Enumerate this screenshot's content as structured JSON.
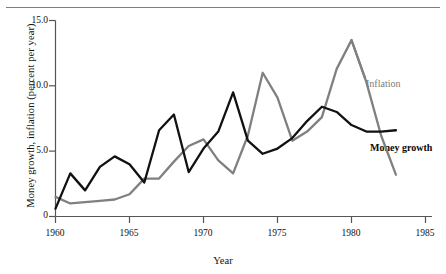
{
  "figure": {
    "ylabel": "Money growth, inflation (percent per year)",
    "xlabel": "Year",
    "top_rule": "horizontal-rule"
  },
  "axes": {
    "ytick_labels": [
      "15.0",
      "10.0",
      "5.0",
      "0"
    ],
    "ytick_values": [
      15.0,
      10.0,
      5.0,
      0
    ],
    "xtick_labels": [
      "1960",
      "1965",
      "1970",
      "1975",
      "1980",
      "1985"
    ],
    "xtick_values": [
      1960,
      1965,
      1970,
      1975,
      1980,
      1985
    ]
  },
  "legend": {
    "inflation_label": "Inflation",
    "money_label": "Money growth"
  },
  "colors": {
    "inflation": "#808080",
    "money_growth": "#111111",
    "axis": "#555555",
    "text": "#111111"
  },
  "chart_data": {
    "type": "line",
    "title": "",
    "xlabel": "Year",
    "ylabel": "Money growth, inflation (percent per year)",
    "xlim": [
      1960,
      1985
    ],
    "ylim": [
      0,
      15
    ],
    "grid": false,
    "legend_position": "inline-right",
    "x": [
      1960,
      1961,
      1962,
      1963,
      1964,
      1965,
      1966,
      1967,
      1968,
      1969,
      1970,
      1971,
      1972,
      1973,
      1974,
      1975,
      1976,
      1977,
      1978,
      1979,
      1980,
      1981,
      1982,
      1983
    ],
    "series": [
      {
        "name": "Money growth",
        "color": "#111111",
        "values": [
          0.6,
          3.3,
          2.0,
          3.8,
          4.6,
          4.0,
          2.6,
          6.6,
          7.8,
          3.4,
          5.2,
          6.5,
          9.5,
          5.8,
          4.8,
          5.2,
          6.0,
          7.3,
          8.4,
          8.0,
          7.0,
          6.5,
          6.5,
          6.6
        ]
      },
      {
        "name": "Inflation",
        "color": "#808080",
        "values": [
          1.5,
          1.0,
          1.1,
          1.2,
          1.3,
          1.7,
          2.9,
          2.9,
          4.2,
          5.4,
          5.9,
          4.3,
          3.3,
          6.2,
          11.0,
          9.1,
          5.8,
          6.5,
          7.6,
          11.3,
          13.5,
          10.3,
          6.2,
          3.2
        ]
      }
    ]
  }
}
